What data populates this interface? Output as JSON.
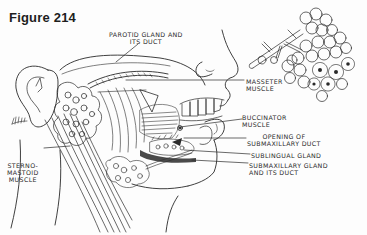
{
  "figure": {
    "title": "Figure 214"
  },
  "labels": {
    "parotid": {
      "line1": "PAROTID GLAND AND",
      "line2": "ITS DUCT"
    },
    "masseter": {
      "line1": "MASSETER",
      "line2": "MUSCLE"
    },
    "buccinator": {
      "line1": "BUCCINATOR",
      "line2": "MUSCLE"
    },
    "opening": {
      "line1": "OPENING OF",
      "line2": "SUBMAXILLARY DUCT"
    },
    "sublingual": {
      "line1": "SUBLINGUAL GLAND"
    },
    "submaxillary": {
      "line1": "SUBMAXILLARY GLAND",
      "line2": "AND ITS DUCT"
    },
    "sternomastoid": {
      "line1": "STERNO-",
      "line2": "MASTOID",
      "line3": "MUSCLE"
    }
  },
  "colors": {
    "ink": "#2a2a2a",
    "paper": "#fdfdfd"
  }
}
